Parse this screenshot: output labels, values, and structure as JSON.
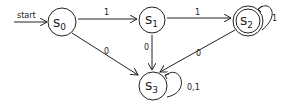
{
  "diagram": {
    "type": "finite-state-automaton",
    "start_label": "start",
    "states": [
      {
        "id": "s0",
        "name": "s",
        "sub": "0",
        "accepting": false,
        "start": true
      },
      {
        "id": "s1",
        "name": "s",
        "sub": "1",
        "accepting": false
      },
      {
        "id": "s2",
        "name": "s",
        "sub": "2",
        "accepting": true
      },
      {
        "id": "s3",
        "name": "s",
        "sub": "3",
        "accepting": false
      }
    ],
    "transitions": [
      {
        "from": "s0",
        "to": "s1",
        "label": "1"
      },
      {
        "from": "s0",
        "to": "s3",
        "label": "0"
      },
      {
        "from": "s1",
        "to": "s2",
        "label": "1"
      },
      {
        "from": "s1",
        "to": "s3",
        "label": "0"
      },
      {
        "from": "s2",
        "to": "s2",
        "label": "1"
      },
      {
        "from": "s2",
        "to": "s3",
        "label": "0"
      },
      {
        "from": "s3",
        "to": "s3",
        "label": "0,1"
      }
    ]
  }
}
